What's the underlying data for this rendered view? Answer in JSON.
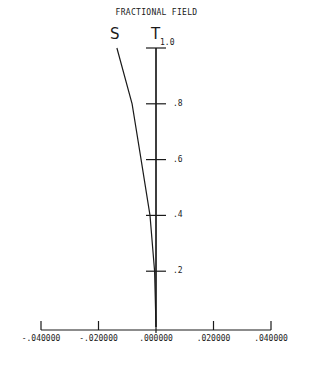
{
  "title": "FRACTIONAL FIELD",
  "labels": {
    "sagittal": "S",
    "tangential": "T"
  },
  "y_ticks": [
    {
      "value": 1.0,
      "label": "1.0"
    },
    {
      "value": 0.8,
      "label": ".8"
    },
    {
      "value": 0.6,
      "label": ".6"
    },
    {
      "value": 0.4,
      "label": ".4"
    },
    {
      "value": 0.2,
      "label": ".2"
    }
  ],
  "x_ticks": [
    {
      "value": -0.04,
      "label": "-.040000"
    },
    {
      "value": -0.02,
      "label": "-.020000"
    },
    {
      "value": 0.0,
      "label": ".000000"
    },
    {
      "value": 0.02,
      "label": ".020000"
    },
    {
      "value": 0.04,
      "label": ".040000"
    }
  ],
  "chart_data": {
    "type": "line",
    "title": "FRACTIONAL FIELD",
    "xlabel": "",
    "ylabel": "FRACTIONAL FIELD",
    "xlim": [
      -0.04,
      0.04
    ],
    "ylim": [
      0,
      1.0
    ],
    "x_tick_labels": [
      "-.040000",
      "-.020000",
      ".000000",
      ".020000",
      ".040000"
    ],
    "y_tick_labels": [
      ".2",
      ".4",
      ".6",
      ".8",
      "1.0"
    ],
    "grid": false,
    "legend": "inline labels at top (S, T)",
    "series": [
      {
        "name": "S",
        "y": [
          0.0,
          0.2,
          0.4,
          0.6,
          0.8,
          1.0
        ],
        "x": [
          0.0,
          -0.0005,
          -0.0021,
          -0.0052,
          -0.0083,
          -0.0136
        ]
      },
      {
        "name": "T",
        "y": [
          0.0,
          0.2,
          0.4,
          0.6,
          0.8,
          1.0
        ],
        "x": [
          0.0,
          0.0,
          0.0,
          0.0,
          0.0,
          0.0
        ]
      }
    ]
  }
}
